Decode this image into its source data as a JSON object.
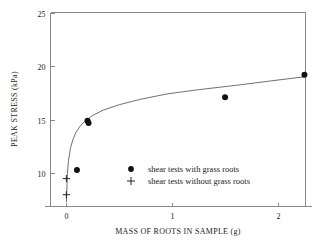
{
  "chart_data": {
    "type": "scatter",
    "title": "",
    "xlabel": "MASS OF ROOTS IN SAMPLE (g)",
    "ylabel": "PEAK STRESS (kPa)",
    "xlim": [
      -0.15,
      2.26
    ],
    "ylim": [
      6.9,
      25
    ],
    "xticks": [
      0,
      1,
      2
    ],
    "xticklabels": [
      "0",
      "1",
      "2"
    ],
    "yticks": [
      10,
      15,
      20,
      25
    ],
    "yticklabels": [
      "10",
      "15",
      "20",
      "25"
    ],
    "grid": false,
    "legend_position": "lower-right",
    "series": [
      {
        "name": "shear tests with grass roots",
        "marker": "filled-circle",
        "color": "#111111",
        "points": [
          {
            "x": 0.1,
            "y": 10.3
          },
          {
            "x": 0.2,
            "y": 14.9
          },
          {
            "x": 0.21,
            "y": 14.7
          },
          {
            "x": 1.5,
            "y": 17.1
          },
          {
            "x": 2.25,
            "y": 19.2
          }
        ]
      },
      {
        "name": "shear tests without grass roots",
        "marker": "plus",
        "color": "#222222",
        "points": [
          {
            "x": 0.0,
            "y": 9.5
          },
          {
            "x": 0.0,
            "y": 8.0
          }
        ]
      }
    ],
    "fit_curve": {
      "name": "logarithmic trend line",
      "color": "#5f5f5f",
      "points": [
        {
          "x": 0.0,
          "y": 7.3
        },
        {
          "x": 0.01,
          "y": 10.0
        },
        {
          "x": 0.02,
          "y": 11.2
        },
        {
          "x": 0.04,
          "y": 12.4
        },
        {
          "x": 0.06,
          "y": 13.1
        },
        {
          "x": 0.09,
          "y": 13.8
        },
        {
          "x": 0.13,
          "y": 14.4
        },
        {
          "x": 0.18,
          "y": 14.9
        },
        {
          "x": 0.25,
          "y": 15.4
        },
        {
          "x": 0.35,
          "y": 15.9
        },
        {
          "x": 0.5,
          "y": 16.4
        },
        {
          "x": 0.7,
          "y": 16.9
        },
        {
          "x": 0.95,
          "y": 17.4
        },
        {
          "x": 1.25,
          "y": 17.8
        },
        {
          "x": 1.6,
          "y": 18.2
        },
        {
          "x": 2.0,
          "y": 18.7
        },
        {
          "x": 2.25,
          "y": 19.0
        }
      ]
    }
  },
  "legend": {
    "entries": [
      {
        "label": "shear tests with grass roots",
        "marker": "filled-circle"
      },
      {
        "label": "shear tests without grass roots",
        "marker": "plus"
      }
    ]
  }
}
